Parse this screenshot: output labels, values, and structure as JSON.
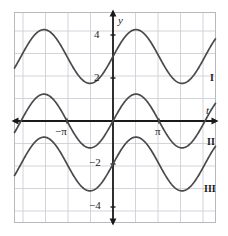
{
  "figure": {
    "title": "",
    "axis_labels": {
      "x": "t",
      "y": "y"
    },
    "curve_labels": [
      "I",
      "II",
      "III"
    ],
    "y_tick_labels": [
      "4",
      "2",
      "−2",
      "−4"
    ],
    "x_tick_labels": [
      "−π",
      "π"
    ],
    "colors": {
      "curve": "#4a4a4a",
      "axis": "#1a1a1a",
      "grid": "#c9c9d2",
      "frame": "#b8b8c0",
      "background": "#ffffff",
      "text": "#1a1a1a"
    }
  },
  "chart_data": {
    "type": "line",
    "title": "",
    "xlabel": "t",
    "ylabel": "y",
    "xlim": [
      -4.5,
      4.5
    ],
    "ylim": [
      -5.1,
      5.1
    ],
    "grid": true,
    "legend": "inline-right-labels",
    "x_ticks": [
      -3.14159,
      3.14159
    ],
    "x_tick_labels": [
      "−π",
      "π"
    ],
    "y_ticks": [
      4,
      2,
      -2,
      -4
    ],
    "y_tick_labels": [
      "4",
      "2",
      "−2",
      "−4"
    ],
    "series": [
      {
        "name": "I",
        "label": "I",
        "form": "y = 3 + 1.25 sin(t)",
        "midline": 3,
        "amplitude": 1.25,
        "period": 6.28319,
        "phase": 0,
        "max": 4.25,
        "min": 1.75
      },
      {
        "name": "II",
        "label": "II",
        "form": "y = 1.25 sin(t)",
        "midline": 0,
        "amplitude": 1.25,
        "period": 6.28319,
        "phase": 0,
        "max": 1.25,
        "min": -1.25
      },
      {
        "name": "III",
        "label": "III",
        "form": "y = −2 + 1.25 sin(t)",
        "midline": -2,
        "amplitude": 1.25,
        "period": 6.28319,
        "phase": 0,
        "max": -0.75,
        "min": -3.25
      }
    ]
  }
}
